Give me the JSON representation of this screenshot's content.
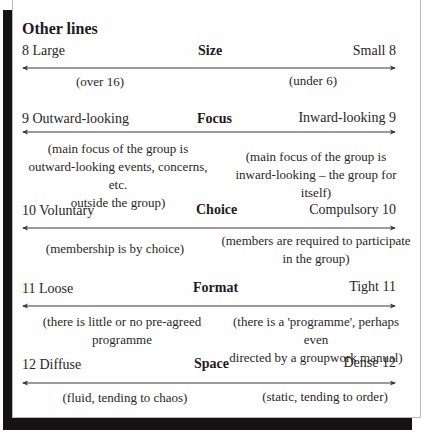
{
  "heading": "Other lines",
  "dimensions": [
    {
      "number": "8",
      "title": "Size",
      "left_label": "8 Large",
      "right_label": "Small 8",
      "left_desc": "(over 16)",
      "right_desc": "(under 6)"
    },
    {
      "number": "9",
      "title": "Focus",
      "left_label": "9 Outward-looking",
      "right_label": "Inward-looking 9",
      "left_desc": "(main focus of the group is\noutward-looking events, concerns, etc.\noutside the group)",
      "right_desc": "(main focus of the group is\ninward-looking – the group for itself)"
    },
    {
      "number": "10",
      "title": "Choice",
      "left_label": "10 Voluntary",
      "right_label": "Compulsory 10",
      "left_desc": "(membership is by choice)",
      "right_desc": "(members are required to participate\nin the group)"
    },
    {
      "number": "11",
      "title": "Format",
      "left_label": "11 Loose",
      "right_label": "Tight 11",
      "left_desc": "(there is little or no pre-agreed\nprogramme",
      "right_desc": "(there is a 'programme', perhaps even\ndirected by a groupwork manual)"
    },
    {
      "number": "12",
      "title": "Space",
      "left_label": "12 Diffuse",
      "right_label": "Dense 12",
      "left_desc": "(fluid, tending to chaos)",
      "right_desc": "(static, tending to order)"
    }
  ],
  "colors": {
    "shadow": "#141213",
    "card_border": "#b9b9b9",
    "text": "#2a2627",
    "arrow": "#3a3637"
  }
}
